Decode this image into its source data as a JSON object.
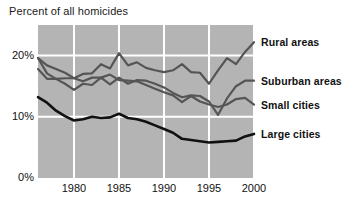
{
  "chart_data": {
    "type": "line",
    "title": "Percent of all homicides",
    "xlabel": "",
    "ylabel": "Percent of all homicides",
    "xlim": [
      1976,
      2000
    ],
    "ylim": [
      0,
      25
    ],
    "yticks": [
      "0%",
      "10%",
      "20%"
    ],
    "ytick_values": [
      0,
      10,
      20
    ],
    "xticks": [
      "1980",
      "1985",
      "1990",
      "1995",
      "2000"
    ],
    "xtick_values": [
      1980,
      1985,
      1990,
      1995,
      2000
    ],
    "grid": true,
    "legend_position": "right-of-plot",
    "x": [
      1976,
      1977,
      1978,
      1979,
      1980,
      1981,
      1982,
      1983,
      1984,
      1985,
      1986,
      1987,
      1988,
      1989,
      1990,
      1991,
      1992,
      1993,
      1994,
      1995,
      1996,
      1997,
      1998,
      1999,
      2000
    ],
    "series": [
      {
        "name": "Rural areas",
        "color": "#555555",
        "values": [
          19.6,
          18.4,
          17.8,
          17.2,
          16.3,
          17.0,
          17.1,
          18.6,
          17.9,
          20.4,
          18.4,
          18.9,
          18.0,
          17.6,
          17.3,
          17.6,
          18.6,
          17.3,
          17.2,
          15.4,
          17.6,
          19.6,
          18.6,
          20.6,
          22.2
        ]
      },
      {
        "name": "Suburban areas",
        "color": "#555555",
        "values": [
          17.8,
          16.2,
          16.2,
          15.4,
          14.4,
          15.4,
          15.2,
          16.4,
          15.3,
          16.4,
          15.4,
          16.0,
          15.9,
          15.4,
          14.8,
          13.9,
          13.2,
          13.5,
          13.4,
          12.5,
          10.3,
          13.0,
          15.0,
          15.9,
          15.9
        ]
      },
      {
        "name": "Small cities",
        "color": "#555555",
        "values": [
          19.6,
          17.1,
          16.2,
          16.3,
          16.3,
          15.8,
          16.4,
          16.4,
          16.9,
          16.0,
          15.9,
          15.8,
          15.2,
          14.6,
          14.0,
          13.5,
          12.4,
          13.4,
          12.5,
          12.0,
          11.6,
          12.0,
          12.9,
          13.1,
          12.0
        ]
      },
      {
        "name": "Large cities",
        "color": "#111111",
        "values": [
          13.2,
          12.3,
          11.0,
          10.1,
          9.4,
          9.6,
          10.0,
          9.8,
          9.9,
          10.5,
          9.8,
          9.6,
          9.2,
          8.6,
          8.0,
          7.4,
          6.4,
          6.2,
          6.0,
          5.8,
          5.9,
          6.0,
          6.1,
          6.8,
          7.2
        ]
      }
    ],
    "legend": [
      {
        "label": "Rural areas"
      },
      {
        "label": "Suburban areas"
      },
      {
        "label": "Small cities"
      },
      {
        "label": "Large cities"
      }
    ]
  }
}
